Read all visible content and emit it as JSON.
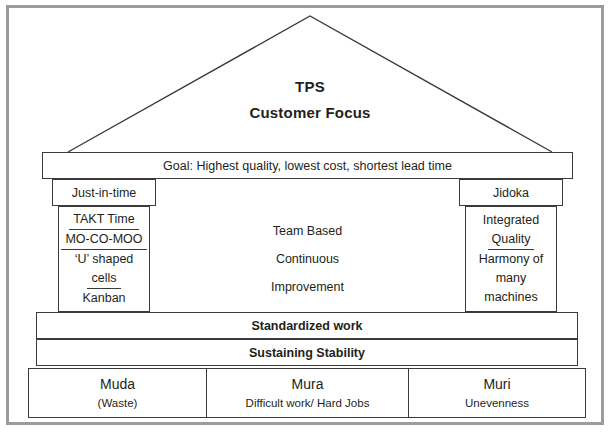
{
  "diagram": {
    "title_line1": "TPS",
    "title_line2": "Customer Focus",
    "goal": "Goal: Highest quality, lowest cost, shortest lead time",
    "left_pillar": {
      "header": "Just-in-time",
      "items": [
        {
          "text": "TAKT Time",
          "underline": true
        },
        {
          "text": "MO-CO-MOO",
          "underline": true
        },
        {
          "text": "‘U’ shaped",
          "underline": false
        },
        {
          "text": "cells",
          "underline": true
        },
        {
          "text": "Kanban",
          "underline": false
        }
      ]
    },
    "right_pillar": {
      "header": "Jidoka",
      "items": [
        {
          "text": "Integrated",
          "underline": false
        },
        {
          "text": "Quality",
          "underline": true
        },
        {
          "text": "Harmony of",
          "underline": false
        },
        {
          "text": "many",
          "underline": false
        },
        {
          "text": "machines",
          "underline": false
        }
      ]
    },
    "center": {
      "line1": "Team Based",
      "line2": "Continuous",
      "line3": "Improvement"
    },
    "bands": {
      "band1": "Standardized work",
      "band2": "Sustaining Stability"
    },
    "foundation": [
      {
        "title": "Muda",
        "subtitle": "(Waste)"
      },
      {
        "title": "Mura",
        "subtitle": "Difficult work/ Hard Jobs"
      },
      {
        "title": "Muri",
        "subtitle": "Unevenness"
      }
    ],
    "colors": {
      "line": "#3a3a3a",
      "frame": "#9b9b9b",
      "text": "#231f20",
      "background": "#ffffff"
    }
  }
}
